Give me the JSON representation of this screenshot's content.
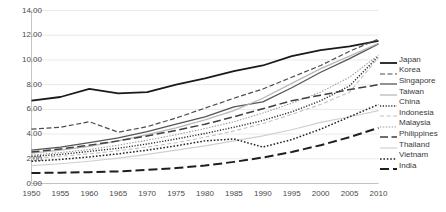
{
  "chart_data": {
    "type": "line",
    "title": "",
    "xlabel": "",
    "ylabel": "",
    "grid": true,
    "legend_position": "right",
    "x": [
      1950,
      1955,
      1960,
      1965,
      1970,
      1975,
      1980,
      1985,
      1990,
      1995,
      2000,
      2005,
      2010
    ],
    "xlim": [
      1950,
      2010
    ],
    "ylim": [
      0.0,
      14.0
    ],
    "yticks": [
      "0.00",
      "2.00",
      "4.00",
      "6.00",
      "8.00",
      "10.00",
      "12.00",
      "14.00"
    ],
    "ytick_values": [
      0,
      2,
      4,
      6,
      8,
      10,
      12,
      14
    ],
    "xticks": [
      "1950",
      "1955",
      "1960",
      "1965",
      "1970",
      "1975",
      "1980",
      "1985",
      "1990",
      "1995",
      "2000",
      "2005",
      "2010"
    ],
    "series": [
      {
        "name": "Japan",
        "style": "solid",
        "width": 1.8,
        "color": "#1a1a1a",
        "values": [
          6.7,
          7.0,
          7.65,
          7.3,
          7.4,
          8.0,
          8.5,
          9.1,
          9.55,
          10.3,
          10.8,
          11.1,
          11.55
        ]
      },
      {
        "name": "Korea",
        "style": "dashed",
        "width": 1.2,
        "color": "#4d4d4d",
        "values": [
          4.4,
          4.55,
          5.0,
          4.15,
          4.6,
          5.3,
          6.1,
          6.9,
          7.65,
          8.6,
          9.55,
          10.7,
          11.7
        ]
      },
      {
        "name": "Singapore",
        "style": "solid",
        "width": 1.3,
        "color": "#555555",
        "values": [
          2.7,
          2.95,
          3.3,
          3.7,
          4.2,
          4.8,
          5.4,
          6.2,
          6.6,
          7.75,
          9.0,
          10.1,
          11.3
        ]
      },
      {
        "name": "Taiwan",
        "style": "solid",
        "width": 1.3,
        "color": "#b8b8b8",
        "values": [
          2.45,
          2.7,
          3.0,
          3.45,
          3.95,
          4.5,
          5.15,
          5.9,
          6.9,
          8.1,
          9.3,
          10.3,
          11.35
        ]
      },
      {
        "name": "China",
        "style": "dotted",
        "width": 1.4,
        "color": "#2b2b2b",
        "values": [
          2.2,
          2.35,
          2.6,
          2.85,
          3.2,
          3.6,
          4.05,
          4.55,
          5.1,
          5.8,
          6.7,
          7.9,
          10.3
        ]
      },
      {
        "name": "Indonesia",
        "style": "dashed-light",
        "width": 1.1,
        "color": "#c2c2c2",
        "values": [
          2.05,
          2.2,
          2.4,
          2.65,
          2.95,
          3.3,
          3.75,
          4.25,
          4.85,
          5.6,
          6.4,
          7.4,
          10.2
        ]
      },
      {
        "name": "Malaysia",
        "style": "dash-dot",
        "width": 1.1,
        "color": "#9a9a9a",
        "values": [
          2.3,
          2.5,
          2.75,
          3.1,
          3.5,
          3.95,
          4.45,
          5.0,
          5.7,
          6.5,
          7.4,
          8.6,
          10.4
        ]
      },
      {
        "name": "Philippines",
        "style": "long-dash",
        "width": 1.5,
        "color": "#3f3f3f",
        "values": [
          2.55,
          2.8,
          3.1,
          3.45,
          3.85,
          4.3,
          4.8,
          5.4,
          6.05,
          6.7,
          7.15,
          7.6,
          8.0
        ]
      },
      {
        "name": "Thailand",
        "style": "solid-light",
        "width": 1.2,
        "color": "#d0d0d0",
        "values": [
          1.45,
          1.6,
          1.8,
          2.05,
          2.35,
          2.7,
          3.05,
          3.45,
          3.85,
          4.35,
          4.95,
          5.4,
          5.9
        ]
      },
      {
        "name": "Vietnam",
        "style": "dotted-bold",
        "width": 1.5,
        "color": "#222222",
        "values": [
          1.8,
          1.95,
          2.15,
          2.4,
          2.7,
          3.05,
          3.45,
          3.6,
          2.95,
          3.55,
          4.4,
          5.4,
          6.4
        ]
      },
      {
        "name": "India",
        "style": "long-dash-bold",
        "width": 2.0,
        "color": "#1f1f1f",
        "values": [
          0.85,
          0.88,
          0.92,
          0.98,
          1.1,
          1.25,
          1.45,
          1.75,
          2.1,
          2.55,
          3.1,
          3.75,
          4.5
        ]
      }
    ]
  },
  "legend": {
    "items": [
      {
        "label": "Japan"
      },
      {
        "label": "Korea"
      },
      {
        "label": "Singapore"
      },
      {
        "label": "Taiwan"
      },
      {
        "label": "China"
      },
      {
        "label": "Indonesia"
      },
      {
        "label": "Malaysia"
      },
      {
        "label": "Philippines"
      },
      {
        "label": "Thailand"
      },
      {
        "label": "Vietnam"
      },
      {
        "label": "India"
      }
    ]
  },
  "colors": {
    "gridline": "#e3e3e3",
    "axis": "#bdbdbd",
    "text": "#4a4a4a",
    "background": "#ffffff"
  }
}
